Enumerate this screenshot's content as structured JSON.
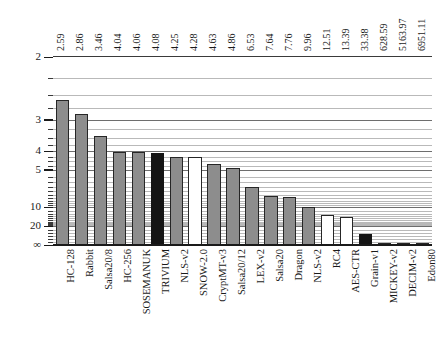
{
  "chart_data": {
    "type": "bar",
    "title": "",
    "subtitle": "",
    "xlabel": "",
    "ylabel": "",
    "orientation": "vertical",
    "grid": true,
    "legend_position": "none",
    "y_scale": "reciprocal-inverted",
    "y_axis_note": "Axis is inverted: smaller values plot higher; bar height proportional to 1/value",
    "ylim": [
      2,
      "∞"
    ],
    "ytick_labels": [
      "2",
      "3",
      "4",
      "5",
      "10",
      "20",
      "∞"
    ],
    "ytick_values": [
      2,
      3,
      4,
      5,
      10,
      20,
      0
    ],
    "categories": [
      "HC-128",
      "Rabbit",
      "Salsa20/8",
      "HC-256",
      "SOSEMANUK",
      "TRIVIUM",
      "NLS-v2",
      "SNOW-2.0",
      "CryptMT-v3",
      "Salsa20/12",
      "LEX-v2",
      "Salsa20",
      "Dragon",
      "NLS-v2",
      "RC4",
      "AES-CTR",
      "Grain-v1",
      "MICKEY-v2",
      "DECIM-v2",
      "Edon80"
    ],
    "values": [
      2.59,
      2.86,
      3.46,
      4.04,
      4.06,
      4.08,
      4.25,
      4.28,
      4.63,
      4.86,
      6.53,
      7.64,
      7.76,
      9.96,
      12.51,
      13.39,
      33.38,
      628.59,
      5163.97,
      6951.11
    ],
    "value_labels": [
      "2.59",
      "2.86",
      "3.46",
      "4.04",
      "4.06",
      "4.08",
      "4.25",
      "4.28",
      "4.63",
      "4.86",
      "6.53",
      "7.64",
      "7.76",
      "9.96",
      "12.51",
      "13.39",
      "33.38",
      "628.59",
      "5163.97",
      "6951.11"
    ],
    "bar_styles": [
      "gray",
      "gray",
      "gray",
      "gray",
      "gray",
      "black",
      "gray",
      "white",
      "gray",
      "gray",
      "gray",
      "gray",
      "gray",
      "gray",
      "white",
      "white",
      "black",
      "gray",
      "gray",
      "gray"
    ],
    "colors": {
      "gray": "#8d8d8d",
      "black": "#141414",
      "white": "#ffffff",
      "bar_border": "#262626",
      "gridline": "#b9b9b9",
      "gridline_major": "#6e6e6e",
      "axis": "#1a1a1a"
    }
  }
}
